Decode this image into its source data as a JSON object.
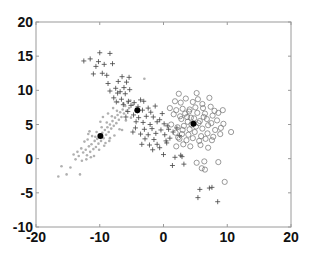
{
  "chart_data": {
    "type": "scatter",
    "title": "",
    "xlabel": "",
    "ylabel": "",
    "xlim": [
      -20,
      20
    ],
    "ylim": [
      -10,
      20
    ],
    "grid": false,
    "legend": null,
    "x_ticks": [
      -20,
      -10,
      0,
      10,
      20
    ],
    "y_ticks": [
      -10,
      -5,
      0,
      5,
      10,
      15,
      20
    ],
    "x_tick_labels": [
      "-20",
      "-10",
      "0",
      "10",
      "20"
    ],
    "y_tick_labels": [
      "-10",
      "-5",
      "0",
      "5",
      "10",
      "15",
      "20"
    ],
    "series": [
      {
        "name": "cluster-dots",
        "marker": "dot",
        "color": "#b0b0b0",
        "points": [
          [
            -16.5,
            -2.6
          ],
          [
            -15.2,
            -2.3
          ],
          [
            -14.6,
            -1.3
          ],
          [
            -13.1,
            -2.3
          ],
          [
            -16.0,
            -1.1
          ],
          [
            -13.8,
            -0.1
          ],
          [
            -13.3,
            0.4
          ],
          [
            -12.8,
            -0.3
          ],
          [
            -12.6,
            0.9
          ],
          [
            -12.2,
            1.3
          ],
          [
            -12.0,
            0.5
          ],
          [
            -11.7,
            1.8
          ],
          [
            -11.5,
            1.0
          ],
          [
            -11.3,
            2.1
          ],
          [
            -11.0,
            1.4
          ],
          [
            -10.8,
            2.6
          ],
          [
            -10.6,
            1.7
          ],
          [
            -10.4,
            2.9
          ],
          [
            -10.2,
            2.2
          ],
          [
            -10.0,
            3.4
          ],
          [
            -9.8,
            2.6
          ],
          [
            -9.6,
            3.8
          ],
          [
            -9.4,
            3.0
          ],
          [
            -9.2,
            4.2
          ],
          [
            -9.0,
            3.5
          ],
          [
            -8.8,
            4.6
          ],
          [
            -8.6,
            3.9
          ],
          [
            -8.4,
            5.0
          ],
          [
            -8.2,
            4.4
          ],
          [
            -8.0,
            5.5
          ],
          [
            -7.8,
            4.8
          ],
          [
            -7.6,
            6.0
          ],
          [
            -7.4,
            5.2
          ],
          [
            -7.2,
            6.4
          ],
          [
            -7.0,
            5.7
          ],
          [
            -6.8,
            6.8
          ],
          [
            -6.6,
            6.1
          ],
          [
            -6.4,
            7.2
          ],
          [
            -6.2,
            6.6
          ],
          [
            -6.0,
            7.7
          ],
          [
            -5.8,
            7.0
          ],
          [
            -5.6,
            8.2
          ],
          [
            -5.4,
            7.4
          ],
          [
            -5.2,
            8.5
          ],
          [
            -12.9,
            1.5
          ],
          [
            -12.4,
            2.5
          ],
          [
            -11.9,
            2.8
          ],
          [
            -11.2,
            3.3
          ],
          [
            -10.9,
            0.4
          ],
          [
            -10.5,
            3.9
          ],
          [
            -10.1,
            1.3
          ],
          [
            -9.7,
            4.6
          ],
          [
            -9.3,
            1.9
          ],
          [
            -8.9,
            5.3
          ],
          [
            -8.5,
            2.6
          ],
          [
            -8.1,
            6.2
          ],
          [
            -7.7,
            3.4
          ],
          [
            -7.3,
            7.0
          ],
          [
            -6.9,
            4.3
          ],
          [
            -9.9,
            5.4
          ],
          [
            -11.6,
            4.0
          ],
          [
            -8.7,
            6.6
          ],
          [
            -7.1,
            8.3
          ],
          [
            -6.5,
            4.2
          ],
          [
            -5.1,
            6.0
          ],
          [
            -13.5,
            1.0
          ],
          [
            -14.1,
            0.6
          ],
          [
            -12.1,
            -0.1
          ],
          [
            -11.4,
            0.2
          ],
          [
            -3.0,
            11.7
          ],
          [
            -8.4,
            3.0
          ],
          [
            -9.1,
            2.3
          ],
          [
            -10.7,
            3.2
          ],
          [
            -11.8,
            3.6
          ],
          [
            -7.9,
            7.4
          ],
          [
            -6.3,
            8.1
          ],
          [
            -5.9,
            5.6
          ],
          [
            -4.8,
            7.9
          ],
          [
            -9.5,
            6.1
          ]
        ]
      },
      {
        "name": "cluster-plus",
        "marker": "plus",
        "color": "#444444",
        "points": [
          [
            -10.0,
            15.5
          ],
          [
            -8.4,
            15.4
          ],
          [
            -12.5,
            14.3
          ],
          [
            -11.5,
            14.6
          ],
          [
            -10.2,
            14.2
          ],
          [
            -9.3,
            13.8
          ],
          [
            -8.0,
            13.9
          ],
          [
            -10.6,
            13.5
          ],
          [
            -9.6,
            12.5
          ],
          [
            -11.0,
            12.4
          ],
          [
            -8.9,
            12.2
          ],
          [
            -6.5,
            12.0
          ],
          [
            -5.4,
            11.9
          ],
          [
            -7.1,
            11.3
          ],
          [
            -5.8,
            11.2
          ],
          [
            -8.7,
            11.0
          ],
          [
            -6.2,
            10.4
          ],
          [
            -7.5,
            10.3
          ],
          [
            -5.3,
            10.1
          ],
          [
            -8.4,
            9.9
          ],
          [
            -7.2,
            9.6
          ],
          [
            -6.0,
            9.5
          ],
          [
            -7.8,
            8.9
          ],
          [
            -6.6,
            8.7
          ],
          [
            -5.5,
            8.4
          ],
          [
            -4.6,
            8.2
          ],
          [
            -3.6,
            8.6
          ],
          [
            -3.1,
            8.4
          ],
          [
            -7.4,
            8.3
          ],
          [
            -6.3,
            7.9
          ],
          [
            -5.1,
            7.8
          ],
          [
            -4.0,
            7.6
          ],
          [
            -2.4,
            7.4
          ],
          [
            -1.3,
            7.7
          ],
          [
            -3.3,
            7.1
          ],
          [
            -2.0,
            6.8
          ],
          [
            -5.6,
            6.9
          ],
          [
            -4.7,
            6.4
          ],
          [
            -3.9,
            6.0
          ],
          [
            -2.7,
            6.2
          ],
          [
            -1.6,
            6.1
          ],
          [
            -0.6,
            5.7
          ],
          [
            -4.3,
            5.4
          ],
          [
            -3.2,
            5.3
          ],
          [
            -2.1,
            5.0
          ],
          [
            -1.0,
            5.4
          ],
          [
            0.1,
            5.1
          ],
          [
            0.6,
            4.8
          ],
          [
            -4.4,
            4.5
          ],
          [
            -3.0,
            4.3
          ],
          [
            -1.8,
            4.4
          ],
          [
            -0.4,
            4.2
          ],
          [
            0.8,
            4.3
          ],
          [
            1.5,
            3.9
          ],
          [
            -3.6,
            3.6
          ],
          [
            -2.4,
            3.5
          ],
          [
            -1.2,
            3.7
          ],
          [
            0.2,
            3.5
          ],
          [
            1.0,
            3.0
          ],
          [
            -2.9,
            2.9
          ],
          [
            -1.5,
            2.8
          ],
          [
            0.4,
            2.6
          ],
          [
            -3.4,
            2.1
          ],
          [
            -2.2,
            2.0
          ],
          [
            -1.0,
            2.1
          ],
          [
            0.5,
            2.3
          ],
          [
            -1.7,
            1.3
          ],
          [
            -0.6,
            1.6
          ],
          [
            0.0,
            0.6
          ],
          [
            1.8,
            0.2
          ],
          [
            2.7,
            0.5
          ],
          [
            2.9,
            0.3
          ],
          [
            1.4,
            -1.0
          ],
          [
            3.2,
            -0.8
          ],
          [
            5.7,
            -4.5
          ],
          [
            7.2,
            -4.3
          ],
          [
            7.6,
            -4.2
          ],
          [
            5.4,
            -5.7
          ],
          [
            8.5,
            -6.3
          ],
          [
            -4.8,
            3.9
          ],
          [
            2.1,
            4.5
          ],
          [
            2.5,
            3.4
          ],
          [
            -0.2,
            6.6
          ],
          [
            -5.9,
            6.1
          ],
          [
            -4.1,
            7.0
          ],
          [
            -6.8,
            9.8
          ]
        ]
      },
      {
        "name": "cluster-circles",
        "marker": "circle",
        "color": "#707070",
        "points": [
          [
            2.4,
            9.5
          ],
          [
            5.2,
            9.6
          ],
          [
            3.5,
            8.8
          ],
          [
            5.4,
            8.7
          ],
          [
            7.2,
            8.9
          ],
          [
            1.8,
            8.4
          ],
          [
            2.7,
            8.2
          ],
          [
            4.6,
            8.3
          ],
          [
            6.1,
            8.0
          ],
          [
            1.0,
            7.4
          ],
          [
            2.0,
            7.1
          ],
          [
            3.0,
            7.3
          ],
          [
            4.1,
            7.2
          ],
          [
            5.0,
            7.5
          ],
          [
            6.2,
            7.4
          ],
          [
            7.4,
            7.6
          ],
          [
            8.0,
            7.0
          ],
          [
            9.3,
            7.1
          ],
          [
            1.6,
            6.5
          ],
          [
            2.6,
            6.2
          ],
          [
            3.4,
            6.6
          ],
          [
            4.3,
            6.0
          ],
          [
            5.3,
            6.7
          ],
          [
            6.5,
            6.6
          ],
          [
            7.7,
            6.3
          ],
          [
            8.6,
            6.7
          ],
          [
            2.8,
            5.8
          ],
          [
            3.8,
            5.4
          ],
          [
            4.8,
            5.9
          ],
          [
            5.7,
            5.5
          ],
          [
            6.8,
            5.8
          ],
          [
            7.5,
            5.2
          ],
          [
            8.4,
            5.6
          ],
          [
            9.4,
            5.1
          ],
          [
            1.2,
            5.0
          ],
          [
            2.2,
            4.6
          ],
          [
            3.2,
            4.8
          ],
          [
            4.1,
            4.3
          ],
          [
            5.1,
            4.7
          ],
          [
            6.1,
            4.4
          ],
          [
            7.0,
            4.9
          ],
          [
            8.1,
            4.2
          ],
          [
            9.0,
            4.5
          ],
          [
            10.6,
            3.9
          ],
          [
            1.9,
            3.8
          ],
          [
            2.9,
            3.6
          ],
          [
            3.9,
            3.5
          ],
          [
            4.9,
            3.9
          ],
          [
            5.9,
            3.3
          ],
          [
            6.9,
            3.7
          ],
          [
            7.8,
            3.2
          ],
          [
            8.9,
            3.6
          ],
          [
            2.5,
            2.9
          ],
          [
            3.6,
            2.7
          ],
          [
            4.6,
            3.0
          ],
          [
            5.6,
            2.6
          ],
          [
            6.6,
            2.9
          ],
          [
            7.6,
            2.7
          ],
          [
            2.0,
            1.8
          ],
          [
            3.1,
            2.1
          ],
          [
            4.2,
            1.8
          ],
          [
            5.8,
            2.0
          ],
          [
            7.0,
            1.6
          ],
          [
            5.2,
            -0.6
          ],
          [
            6.4,
            -0.4
          ],
          [
            8.6,
            -0.5
          ],
          [
            6.0,
            -1.4
          ],
          [
            6.5,
            -1.6
          ],
          [
            9.6,
            -3.4
          ],
          [
            3.0,
            4.2
          ],
          [
            4.4,
            5.0
          ],
          [
            5.5,
            5.2
          ],
          [
            6.3,
            6.1
          ],
          [
            3.7,
            6.1
          ],
          [
            2.3,
            3.1
          ],
          [
            4.0,
            6.9
          ]
        ]
      },
      {
        "name": "centroids",
        "marker": "filled-circle",
        "color": "#000000",
        "points": [
          [
            -9.9,
            3.3
          ],
          [
            -4.1,
            7.1
          ],
          [
            4.7,
            5.1
          ]
        ]
      }
    ]
  }
}
